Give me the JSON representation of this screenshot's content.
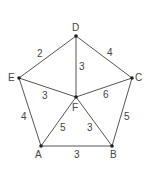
{
  "graph": {
    "nodes": [
      {
        "id": "D",
        "x": 76,
        "y": 36,
        "lx": 72,
        "ly": 31
      },
      {
        "id": "C",
        "x": 132,
        "y": 78,
        "lx": 135,
        "ly": 81
      },
      {
        "id": "E",
        "x": 19,
        "y": 78,
        "lx": 8,
        "ly": 81
      },
      {
        "id": "F",
        "x": 76,
        "y": 97,
        "lx": 72,
        "ly": 111
      },
      {
        "id": "A",
        "x": 41,
        "y": 146,
        "lx": 35,
        "ly": 158
      },
      {
        "id": "B",
        "x": 112,
        "y": 146,
        "lx": 110,
        "ly": 158
      }
    ],
    "edges": [
      {
        "from": "D",
        "to": "E",
        "weight": "2",
        "wx": 37,
        "wy": 57
      },
      {
        "from": "D",
        "to": "C",
        "weight": "4",
        "wx": 107,
        "wy": 56
      },
      {
        "from": "D",
        "to": "F",
        "weight": "3",
        "wx": 79,
        "wy": 70
      },
      {
        "from": "E",
        "to": "F",
        "weight": "3",
        "wx": 42,
        "wy": 99
      },
      {
        "from": "C",
        "to": "F",
        "weight": "6",
        "wx": 103,
        "wy": 98
      },
      {
        "from": "E",
        "to": "A",
        "weight": "4",
        "wx": 21,
        "wy": 120
      },
      {
        "from": "C",
        "to": "B",
        "weight": "5",
        "wx": 124,
        "wy": 120
      },
      {
        "from": "F",
        "to": "A",
        "weight": "5",
        "wx": 60,
        "wy": 131
      },
      {
        "from": "F",
        "to": "B",
        "weight": "3",
        "wx": 87,
        "wy": 131
      },
      {
        "from": "A",
        "to": "B",
        "weight": "3",
        "wx": 74,
        "wy": 158
      }
    ]
  }
}
